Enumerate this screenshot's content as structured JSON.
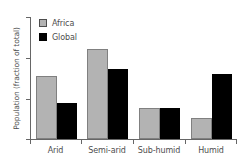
{
  "chart_data": {
    "type": "bar",
    "title": "",
    "xlabel": "",
    "ylabel": "Population (fraction of total)",
    "categories": [
      "Arid",
      "Semi-arid",
      "Sub-humid",
      "Humid"
    ],
    "series": [
      {
        "name": "Africa",
        "color": "#b3b3b3",
        "values": [
          0.156,
          0.222,
          0.076,
          0.051
        ]
      },
      {
        "name": "Global",
        "color": "#000000",
        "values": [
          0.088,
          0.173,
          0.076,
          0.159
        ]
      }
    ],
    "ylim": [
      0,
      0.3
    ],
    "yticks": [
      0,
      0.1,
      0.2,
      0.3
    ],
    "ytick_labels": [
      "",
      "",
      "",
      ""
    ],
    "grid": false,
    "legend_position": "top-left"
  },
  "legend": {
    "items": [
      {
        "label": "Africa",
        "swatch": "gray-outlined-square-icon"
      },
      {
        "label": "Global",
        "swatch": "black-filled-square-icon"
      }
    ]
  },
  "axes": {
    "y_title": "Population (fraction of total)",
    "x_categories": [
      "Arid",
      "Semi-arid",
      "Sub-humid",
      "Humid"
    ]
  }
}
